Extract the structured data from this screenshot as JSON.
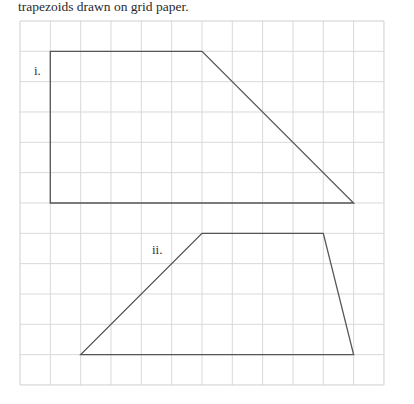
{
  "caption": "trapezoids drawn on grid paper.",
  "grid": {
    "origin_x": 20,
    "origin_y": 21,
    "cell": 30.33,
    "cols": 12,
    "rows": 12,
    "line_color": "#d9d9d9",
    "border_color": "#cfcfcf"
  },
  "shape_stroke": "#555555",
  "shapes": [
    {
      "label": "i.",
      "label_pos": [
        34,
        75
      ],
      "vertices": [
        [
          1,
          1
        ],
        [
          6,
          1
        ],
        [
          11,
          6
        ],
        [
          1,
          6
        ]
      ]
    },
    {
      "label": "ii.",
      "label_pos": [
        152,
        254
      ],
      "vertices": [
        [
          6,
          7
        ],
        [
          10,
          7
        ],
        [
          11,
          11
        ],
        [
          2,
          11
        ]
      ]
    }
  ]
}
